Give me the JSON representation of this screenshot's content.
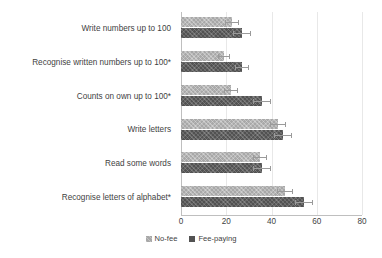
{
  "chart_data": {
    "type": "bar",
    "orientation": "horizontal",
    "title": "",
    "subtitle": "",
    "xlabel": "",
    "ylabel": "",
    "xlim": [
      0,
      80
    ],
    "xticks": [
      0,
      20,
      40,
      60,
      80
    ],
    "xtick_labels": [
      "0",
      "20",
      "40",
      "60",
      "80"
    ],
    "grid": true,
    "grid_axis": "x",
    "legend_position": "bottom-center",
    "categories": [
      "Write numbers up to 100",
      "Recognise written numbers up to 100*",
      "Counts on own up to 100*",
      "Write letters",
      "Read some words",
      "Recognise letters of alphabet*"
    ],
    "series": [
      {
        "name": "No-fee",
        "color": "#a8a8a8",
        "values": [
          22.5,
          19.0,
          22.0,
          43.0,
          35.0,
          46.0
        ],
        "errors": [
          3.0,
          2.5,
          3.0,
          3.5,
          3.0,
          3.5
        ]
      },
      {
        "name": "Fee-paying",
        "color": "#525252",
        "values": [
          27.0,
          27.0,
          36.0,
          45.0,
          36.0,
          54.5
        ],
        "errors": [
          4.0,
          3.0,
          4.0,
          4.0,
          4.0,
          4.0
        ]
      }
    ]
  },
  "legend": {
    "items": [
      {
        "label": "No-fee"
      },
      {
        "label": "Fee-paying"
      }
    ]
  },
  "colors": {
    "no_fee": "#a8a8a8",
    "fee_paying": "#525252",
    "gridline": "#e8e8e8",
    "axis": "#bfbfbf",
    "text": "#3f3f3f",
    "background": "#ffffff"
  }
}
